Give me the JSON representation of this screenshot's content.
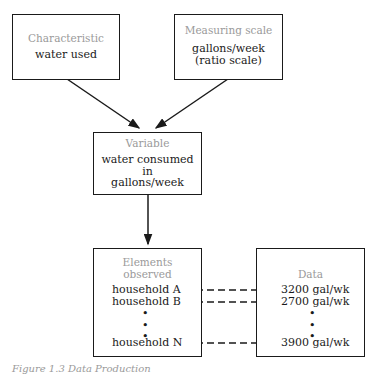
{
  "characteristic": {
    "label": "Characteristic",
    "value": "water used"
  },
  "measuring_scale": {
    "label": "Measuring scale",
    "value_line1": "gallons/week",
    "value_line2": "(ratio scale)"
  },
  "variable": {
    "label": "Variable",
    "line1": "water consumed",
    "line2": "in",
    "line3": "gallons/week"
  },
  "elements": {
    "label_line1": "Elements",
    "label_line2": "observed",
    "items": [
      "household A",
      "household B",
      "household N"
    ]
  },
  "data": {
    "label": "Data",
    "items": [
      "3200 gal/wk",
      "2700 gal/wk",
      "3900 gal/wk"
    ]
  },
  "ellipsis": "•",
  "caption": "Figure 1.3   Data Production"
}
